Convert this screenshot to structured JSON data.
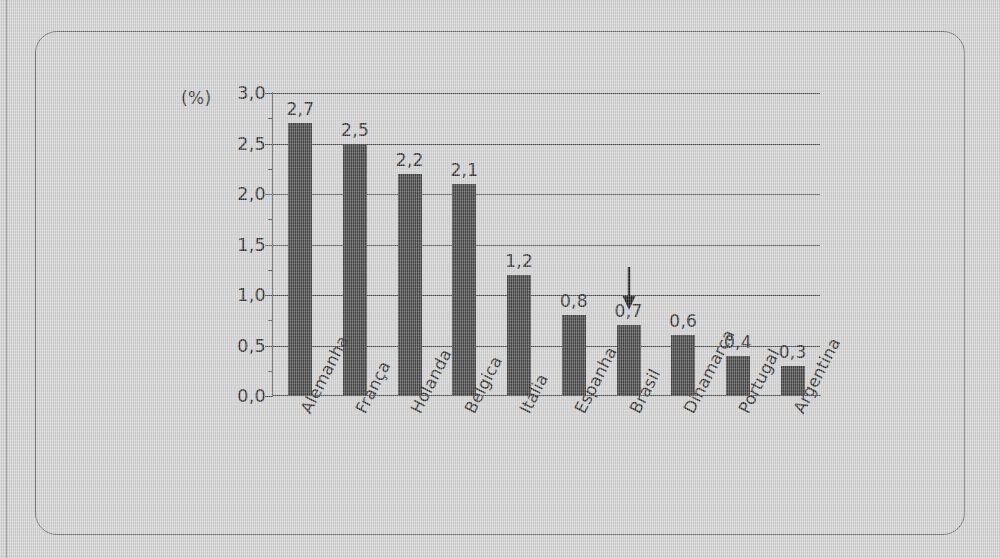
{
  "figure": {
    "percent_axis_label": "(%)"
  },
  "chart_data": {
    "type": "bar",
    "title": "",
    "subtitle": "",
    "xlabel": "",
    "ylabel": "(%)",
    "ylim": [
      0.0,
      3.0
    ],
    "ytick_step": 0.5,
    "grid": true,
    "legend": "none",
    "decimal_separator": ",",
    "bar_color": "#454545",
    "categories": [
      "Alemanha",
      "França",
      "Holanda",
      "Bélgica",
      "Itália",
      "Espanha",
      "Brasil",
      "Dinamarca",
      "Portugal",
      "Argentina"
    ],
    "values": [
      2.7,
      2.5,
      2.2,
      2.1,
      1.2,
      0.8,
      0.7,
      0.6,
      0.4,
      0.3
    ],
    "value_labels": [
      "2,7",
      "2,5",
      "2,2",
      "2,1",
      "1,2",
      "0,8",
      "0,7",
      "0,6",
      "0,4",
      "0,3"
    ],
    "ytick_labels": [
      "3,0",
      "2,5",
      "2,0",
      "1,5",
      "1,0",
      "0,5",
      "0,0"
    ],
    "ytick_values": [
      3.0,
      2.5,
      2.0,
      1.5,
      1.0,
      0.5,
      0.0
    ],
    "annotations": [
      {
        "type": "arrow-down",
        "target_category": "Brasil",
        "target_value": 0.7
      }
    ]
  }
}
